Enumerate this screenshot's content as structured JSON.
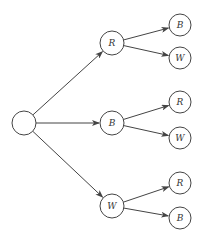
{
  "diagram": {
    "type": "tree",
    "root": {
      "id": "root",
      "label": "",
      "x": 24,
      "y": 123
    },
    "level1": [
      {
        "id": "r1",
        "label": "R",
        "x": 112,
        "y": 43
      },
      {
        "id": "b1",
        "label": "B",
        "x": 112,
        "y": 123
      },
      {
        "id": "w1",
        "label": "W",
        "x": 112,
        "y": 206
      }
    ],
    "level2": [
      {
        "id": "r1b",
        "label": "B",
        "x": 180,
        "y": 25,
        "parent": "r1"
      },
      {
        "id": "r1w",
        "label": "W",
        "x": 180,
        "y": 58,
        "parent": "r1"
      },
      {
        "id": "b1r",
        "label": "R",
        "x": 180,
        "y": 102,
        "parent": "b1"
      },
      {
        "id": "b1w",
        "label": "W",
        "x": 180,
        "y": 138,
        "parent": "b1"
      },
      {
        "id": "w1r",
        "label": "R",
        "x": 180,
        "y": 183,
        "parent": "w1"
      },
      {
        "id": "w1b",
        "label": "B",
        "x": 180,
        "y": 218,
        "parent": "w1"
      }
    ],
    "colors": {
      "stroke": "#444444",
      "fill": "#ffffff"
    }
  }
}
